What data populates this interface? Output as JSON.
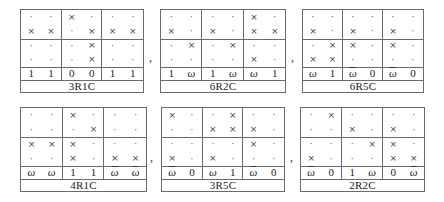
{
  "figure": {
    "separator": ",",
    "tables": [
      {
        "id": "t1",
        "caption": "3R1C",
        "box": {
          "left": 20,
          "top": 9,
          "width": 124,
          "height": 84
        },
        "rows": [
          [
            ".",
            ".",
            "x",
            ".",
            ".",
            "."
          ],
          [
            "x",
            "x",
            ".",
            "x",
            "x",
            "x"
          ],
          [
            ".",
            ".",
            ".",
            "x",
            ".",
            "."
          ],
          [
            ".",
            ".",
            ".",
            "x",
            ".",
            "."
          ]
        ],
        "values": [
          "1",
          "1",
          "0",
          "0",
          "1",
          "1"
        ]
      },
      {
        "id": "t2",
        "caption": "6R2C",
        "box": {
          "left": 160,
          "top": 9,
          "width": 126,
          "height": 84
        },
        "rows": [
          [
            ".",
            ".",
            ".",
            ".",
            "x",
            "."
          ],
          [
            "x",
            ".",
            "x",
            ".",
            "x",
            "x"
          ],
          [
            ".",
            "x",
            ".",
            "x",
            ".",
            "."
          ],
          [
            ".",
            ".",
            ".",
            ".",
            "x",
            "."
          ]
        ],
        "values": [
          "1",
          "ω",
          "1",
          "ω",
          "ω",
          "1"
        ]
      },
      {
        "id": "t3",
        "caption": "6R5C",
        "box": {
          "left": 302,
          "top": 9,
          "width": 122,
          "height": 84
        },
        "rows": [
          [
            ".",
            ".",
            ".",
            ".",
            ".",
            "."
          ],
          [
            "x",
            ".",
            "x",
            ".",
            "x",
            "."
          ],
          [
            ".",
            "x",
            "x",
            ".",
            "x",
            "."
          ],
          [
            "x",
            "x",
            ".",
            ".",
            ".",
            "."
          ]
        ],
        "values": [
          "ω",
          "1",
          "ω̄",
          "0",
          "ω̄",
          "0"
        ]
      },
      {
        "id": "b1",
        "caption": "4R1C",
        "box": {
          "left": 20,
          "top": 107,
          "width": 127,
          "height": 85
        },
        "rows": [
          [
            ".",
            ".",
            "x",
            ".",
            ".",
            "."
          ],
          [
            ".",
            ".",
            ".",
            "x",
            ".",
            "."
          ],
          [
            "x",
            "x",
            "x",
            ".",
            ".",
            "."
          ],
          [
            ".",
            ".",
            "x",
            ".",
            "x",
            "x"
          ]
        ],
        "values": [
          "ω",
          "ω",
          "1",
          "1",
          "ω̄",
          "ω̄"
        ]
      },
      {
        "id": "b2",
        "caption": "3R5C",
        "box": {
          "left": 161,
          "top": 107,
          "width": 124,
          "height": 85
        },
        "rows": [
          [
            "x",
            ".",
            ".",
            "x",
            ".",
            "."
          ],
          [
            ".",
            ".",
            "x",
            "x",
            "x",
            "."
          ],
          [
            ".",
            ".",
            ".",
            ".",
            "x",
            "."
          ],
          [
            "x",
            ".",
            "x",
            ".",
            ".",
            "."
          ]
        ],
        "values": [
          "ω̄",
          "0",
          "ω",
          "1",
          "ω̄",
          "0"
        ]
      },
      {
        "id": "b3",
        "caption": "2R2C",
        "box": {
          "left": 300,
          "top": 107,
          "width": 125,
          "height": 85
        },
        "rows": [
          [
            ".",
            "x",
            ".",
            ".",
            ".",
            "."
          ],
          [
            ".",
            ".",
            "x",
            ".",
            "x",
            "."
          ],
          [
            ".",
            ".",
            ".",
            "x",
            "x",
            "."
          ],
          [
            "x",
            ".",
            ".",
            ".",
            "x",
            "x"
          ]
        ],
        "values": [
          "ω̄",
          "0",
          "1",
          "ω",
          "0",
          "ω̄"
        ]
      }
    ],
    "commas": [
      {
        "left": 149,
        "top": 50
      },
      {
        "left": 291,
        "top": 50
      },
      {
        "left": 150,
        "top": 150
      },
      {
        "left": 290,
        "top": 150
      }
    ]
  }
}
